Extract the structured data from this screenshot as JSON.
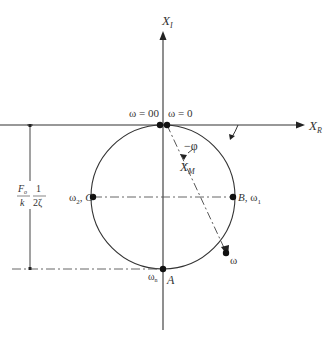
{
  "diagram": {
    "type": "resonance-circle",
    "axes": {
      "imaginary": {
        "label": "X",
        "subscript": "I"
      },
      "real": {
        "label": "X",
        "subscript": "R"
      }
    },
    "points": {
      "top_left": {
        "label": "ω = 00"
      },
      "top_right": {
        "label": "ω = 0"
      },
      "left": {
        "label_omega": "ω",
        "label_sub": "2",
        "label_letter": ", C"
      },
      "right": {
        "label_letter": "B",
        "label_omega": ", ω",
        "label_sub": "1"
      },
      "bottom": {
        "label_omega": "ω",
        "label_sub": "n",
        "label_letter": "A"
      },
      "moving": {
        "label": "ω"
      }
    },
    "phase_label": "−φ",
    "magnitude_label": {
      "text": "X",
      "sub": "M"
    },
    "diameter_label": {
      "frac1_num": "F",
      "frac1_num_sub": "o",
      "frac1_den": "k",
      "frac2_num": "1",
      "frac2_den": "2ζ"
    }
  }
}
